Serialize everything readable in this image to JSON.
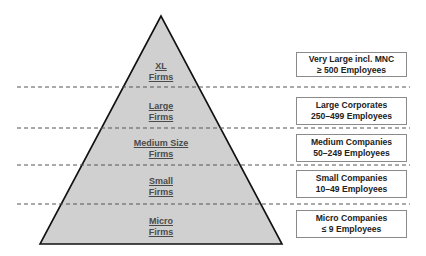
{
  "colors": {
    "pyramid_fill": "#d0d0d0",
    "pyramid_stroke": "#111111",
    "dash": "#555555",
    "box_border": "#8a8a8a"
  },
  "tiers": [
    {
      "name": "xl",
      "label_line1": "XL",
      "label_line2": "Firms",
      "desc_line1": "Very Large incl. MNC",
      "desc_line2": "≥ 500 Employees"
    },
    {
      "name": "large",
      "label_line1": "Large",
      "label_line2": "Firms",
      "desc_line1": "Large Corporates",
      "desc_line2": "250–499 Employees"
    },
    {
      "name": "medium",
      "label_line1": "Medium Size",
      "label_line2": "Firms",
      "desc_line1": "Medium Companies",
      "desc_line2": "50–249 Employees"
    },
    {
      "name": "small",
      "label_line1": "Small",
      "label_line2": "Firms",
      "desc_line1": "Small Companies",
      "desc_line2": "10–49  Employees"
    },
    {
      "name": "micro",
      "label_line1": "Micro",
      "label_line2": "Firms",
      "desc_line1": "Micro Companies",
      "desc_line2": "≤ 9 Employees"
    }
  ]
}
